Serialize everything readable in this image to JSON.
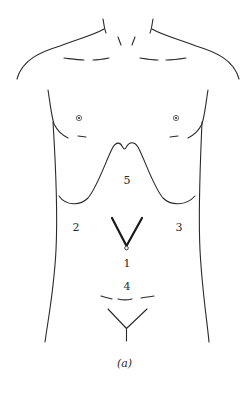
{
  "figure": {
    "caption": "(a)",
    "line_color": "#2a2a2a",
    "background": "#ffffff"
  },
  "regions": [
    {
      "id": "1",
      "label": "1",
      "description": "umbilical region below incision vertex"
    },
    {
      "id": "2",
      "label": "2",
      "description": "right flank"
    },
    {
      "id": "3",
      "label": "3",
      "description": "left flank"
    },
    {
      "id": "4",
      "label": "4",
      "description": "hypogastric region"
    },
    {
      "id": "5",
      "label": "5",
      "description": "epigastric region below costal margin"
    }
  ],
  "marks": {
    "incision": "V-shaped incision converging at umbilicus",
    "pubic": "Y-shaped pubic line",
    "costal_margin": "inverted-W rib margin curve"
  }
}
